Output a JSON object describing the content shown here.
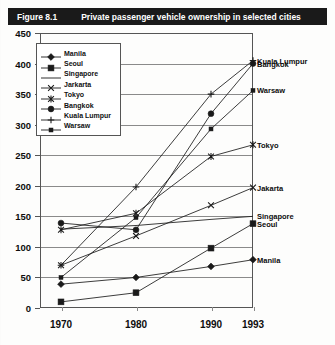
{
  "figure": {
    "number": "Figure 8.1",
    "title": "Private passenger vehicle ownership in selected cities"
  },
  "axes": {
    "y_ticks": [
      "450",
      "400",
      "350",
      "300",
      "250",
      "200",
      "150",
      "100",
      "50",
      "0"
    ],
    "x_ticks": [
      "1970",
      "1980",
      "1990",
      "1993"
    ],
    "ylabel": "",
    "xlabel": ""
  },
  "legend": {
    "position": "top-left",
    "items": [
      {
        "label": "Manila",
        "marker": "diamond-marker"
      },
      {
        "label": "Seoul",
        "marker": "square-marker"
      },
      {
        "label": "Singapore",
        "marker": "line-marker"
      },
      {
        "label": "Jarkarta",
        "marker": "x-marker"
      },
      {
        "label": "Tokyo",
        "marker": "asterisk-marker"
      },
      {
        "label": "Bangkok",
        "marker": "circle-marker"
      },
      {
        "label": "Kuala Lumpur",
        "marker": "plus-marker"
      },
      {
        "label": "Warsaw",
        "marker": "small-square-marker"
      }
    ]
  },
  "end_labels": [
    {
      "label": "Kuala Lumpur",
      "value": 405
    },
    {
      "label": "Bangkok",
      "value": 400
    },
    {
      "label": "Warsaw",
      "value": 356
    },
    {
      "label": "Tokyo",
      "value": 267
    },
    {
      "label": "Jakarta",
      "value": 197
    },
    {
      "label": "Singapore",
      "value": 150
    },
    {
      "label": "Seoul",
      "value": 138
    },
    {
      "label": "Manila",
      "value": 79
    }
  ],
  "chart_data": {
    "type": "line",
    "title": "Private passenger vehicle ownership in selected cities",
    "xlabel": "",
    "ylabel": "",
    "x": [
      "1970",
      "1980",
      "1990",
      "1993"
    ],
    "categories": [
      "1970",
      "1980",
      "1990",
      "1993"
    ],
    "ylim": [
      0,
      450
    ],
    "ytick_step": 50,
    "grid": true,
    "legend_position": "top-left inside plot",
    "series": [
      {
        "name": "Manila",
        "marker": "diamond",
        "values": [
          39,
          50,
          68,
          79
        ]
      },
      {
        "name": "Seoul",
        "marker": "square",
        "values": [
          10,
          25,
          98,
          138
        ]
      },
      {
        "name": "Singapore",
        "marker": "none",
        "values": [
          129,
          135,
          145,
          150
        ]
      },
      {
        "name": "Jarkarta",
        "marker": "x",
        "values": [
          70,
          118,
          168,
          197
        ]
      },
      {
        "name": "Tokyo",
        "marker": "asterisk",
        "values": [
          128,
          155,
          248,
          267
        ]
      },
      {
        "name": "Bangkok",
        "marker": "circle",
        "values": [
          139,
          128,
          318,
          400
        ]
      },
      {
        "name": "Kuala Lumpur",
        "marker": "plus",
        "values": [
          70,
          198,
          350,
          405
        ]
      },
      {
        "name": "Warsaw",
        "marker": "small-square",
        "values": [
          50,
          148,
          293,
          356
        ]
      }
    ]
  },
  "colors": {
    "line": "#1a1a1a",
    "grid": "#8a8a8a",
    "titlebar": "#1a1a1a",
    "background": "#fdfdfc"
  }
}
